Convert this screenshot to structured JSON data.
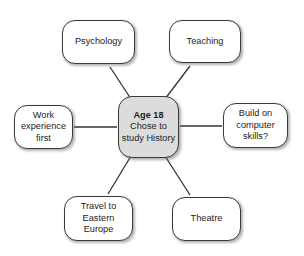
{
  "diagram": {
    "type": "mind-map",
    "background_color": "#ffffff",
    "line_color": "#333333",
    "center_fill_color": "#dcdcdc",
    "node_fill_color": "#ffffff",
    "node_border_color": "#3a3a3a",
    "center": {
      "id": "center",
      "lines": [
        "Age 18",
        "Chose to",
        "study History"
      ],
      "bold_first_line": true
    },
    "branches": [
      {
        "id": "psychology",
        "lines": [
          "Psychology"
        ]
      },
      {
        "id": "teaching",
        "lines": [
          "Teaching"
        ]
      },
      {
        "id": "work",
        "lines": [
          "Work",
          "experience",
          "first"
        ]
      },
      {
        "id": "build",
        "lines": [
          "Build on",
          "computer",
          "skills?"
        ]
      },
      {
        "id": "travel",
        "lines": [
          "Travel to",
          "Eastern",
          "Europe"
        ]
      },
      {
        "id": "theatre",
        "lines": [
          "Theatre"
        ]
      }
    ],
    "edges": [
      {
        "from": "center",
        "to": "psychology",
        "x1": 131,
        "y1": 99,
        "x2": 110,
        "y2": 67
      },
      {
        "from": "center",
        "to": "teaching",
        "x1": 165,
        "y1": 99,
        "x2": 190,
        "y2": 66
      },
      {
        "from": "center",
        "to": "work",
        "x1": 117,
        "y1": 127,
        "x2": 74,
        "y2": 127
      },
      {
        "from": "center",
        "to": "build",
        "x1": 180,
        "y1": 126,
        "x2": 222,
        "y2": 126
      },
      {
        "from": "center",
        "to": "travel",
        "x1": 131,
        "y1": 156,
        "x2": 108,
        "y2": 194
      },
      {
        "from": "center",
        "to": "theatre",
        "x1": 165,
        "y1": 156,
        "x2": 190,
        "y2": 195
      }
    ]
  }
}
